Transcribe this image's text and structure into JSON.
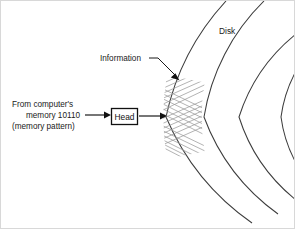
{
  "figure": {
    "title_present": false,
    "background_color": "#ffffff",
    "border_color": "#d8d8d8",
    "line_color": "#3c3c3c",
    "hatch_color": "#9a9a9a",
    "width": 295,
    "height": 229
  },
  "labels": {
    "source_line1": "From computer's",
    "source_line2": "memory 10110",
    "source_line3": "(memory pattern)",
    "head": "Head",
    "information": "Information",
    "disk": "Disk"
  },
  "icons": {
    "arrow_source_to_head": "arrow-right-icon",
    "arrow_head_to_disk": "arrow-right-icon",
    "arrow_information_pointer": "arrow-diagonal-icon"
  },
  "diagram": {
    "type": "disk-write-schematic",
    "center_x": 412,
    "center_y": 116,
    "tracks": [
      {
        "name": "outer-track-arc",
        "radius": 247
      },
      {
        "name": "second-track-arc",
        "radius": 209
      },
      {
        "name": "third-track-arc",
        "radius": 174
      },
      {
        "name": "inner-hub-arc",
        "radius": 132
      }
    ],
    "recorded_region": {
      "name": "information-hatch-band",
      "angle_span_degrees": 52,
      "bands": 4,
      "pattern": "herringbone"
    },
    "head_box": {
      "x": 110,
      "y": 108,
      "width": 26,
      "height": 16
    }
  }
}
